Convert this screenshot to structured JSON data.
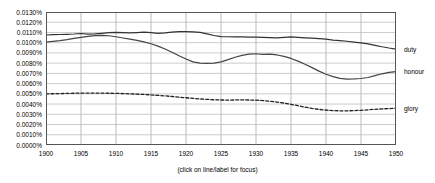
{
  "chart_data": {
    "type": "line",
    "title": "",
    "subtitle": "",
    "xlabel": "",
    "ylabel": "",
    "caption": "(click on line/label for focus)",
    "grid": true,
    "legend_position": "right-inline",
    "xlim": [
      1900,
      1950
    ],
    "ylim": [
      0.0,
      0.013
    ],
    "xticks": [
      1900,
      1905,
      1910,
      1915,
      1920,
      1925,
      1930,
      1935,
      1940,
      1945,
      1950
    ],
    "xtick_labels": [
      "1900",
      "1905",
      "1910",
      "1915",
      "1920",
      "1925",
      "1930",
      "1935",
      "1940",
      "1945",
      "1950"
    ],
    "yticks": [
      0.0,
      0.001,
      0.002,
      0.003,
      0.004,
      0.005,
      0.006,
      0.007,
      0.008,
      0.009,
      0.01,
      0.011,
      0.012,
      0.013
    ],
    "ytick_labels": [
      "0.0000%",
      "0.0010%",
      "0.0020%",
      "0.0030%",
      "0.0040%",
      "0.0050%",
      "0.0060%",
      "0.0070%",
      "0.0080%",
      "0.0090%",
      "0.0100%",
      "0.0110%",
      "0.0120%",
      "0.0130%"
    ],
    "x": [
      1900,
      1901,
      1902,
      1903,
      1904,
      1905,
      1906,
      1907,
      1908,
      1909,
      1910,
      1911,
      1912,
      1913,
      1914,
      1915,
      1916,
      1917,
      1918,
      1919,
      1920,
      1921,
      1922,
      1923,
      1924,
      1925,
      1926,
      1927,
      1928,
      1929,
      1930,
      1931,
      1932,
      1933,
      1934,
      1935,
      1936,
      1937,
      1938,
      1939,
      1940,
      1941,
      1942,
      1943,
      1944,
      1945,
      1946,
      1947,
      1948,
      1949,
      1950
    ],
    "series": [
      {
        "name": "duty",
        "color": "#333333",
        "style": "solid",
        "label_color": "#000000",
        "values": [
          0.01075,
          0.01078,
          0.0108,
          0.01082,
          0.01085,
          0.0109,
          0.01083,
          0.01086,
          0.01092,
          0.01098,
          0.011,
          0.01098,
          0.01095,
          0.01099,
          0.01104,
          0.01098,
          0.01092,
          0.01096,
          0.01104,
          0.01108,
          0.01108,
          0.01106,
          0.011,
          0.01086,
          0.0107,
          0.0106,
          0.01058,
          0.01057,
          0.01056,
          0.01055,
          0.01054,
          0.01052,
          0.0105,
          0.01048,
          0.01052,
          0.01056,
          0.01052,
          0.01048,
          0.01044,
          0.0104,
          0.01034,
          0.01026,
          0.0102,
          0.01014,
          0.01006,
          0.00998,
          0.00988,
          0.00974,
          0.0096,
          0.00948,
          0.00938
        ]
      },
      {
        "name": "honour",
        "color": "#444444",
        "style": "solid",
        "label_color": "#000000",
        "values": [
          0.01005,
          0.01012,
          0.0102,
          0.0103,
          0.01042,
          0.01052,
          0.01062,
          0.0107,
          0.01072,
          0.01068,
          0.01058,
          0.01046,
          0.01034,
          0.01022,
          0.01008,
          0.0099,
          0.00966,
          0.00938,
          0.00906,
          0.00872,
          0.0084,
          0.00812,
          0.008,
          0.00798,
          0.008,
          0.00812,
          0.00834,
          0.00858,
          0.00876,
          0.00888,
          0.00892,
          0.00886,
          0.00888,
          0.0088,
          0.00866,
          0.00846,
          0.0082,
          0.0079,
          0.00756,
          0.00722,
          0.00692,
          0.00668,
          0.00652,
          0.00644,
          0.00646,
          0.0065,
          0.0066,
          0.00678,
          0.00696,
          0.0071,
          0.00718
        ]
      },
      {
        "name": "glory",
        "color": "#222222",
        "style": "dashed",
        "label_color": "#000000",
        "values": [
          0.005,
          0.00501,
          0.00503,
          0.00504,
          0.00506,
          0.00507,
          0.00508,
          0.00508,
          0.00507,
          0.00506,
          0.00505,
          0.00503,
          0.005,
          0.00497,
          0.00494,
          0.0049,
          0.00485,
          0.0048,
          0.00474,
          0.00468,
          0.00462,
          0.00456,
          0.0045,
          0.00446,
          0.00442,
          0.0044,
          0.00439,
          0.0044,
          0.00441,
          0.0044,
          0.00438,
          0.00434,
          0.00428,
          0.0042,
          0.0041,
          0.00398,
          0.00384,
          0.0037,
          0.00358,
          0.00348,
          0.00341,
          0.00336,
          0.00334,
          0.00334,
          0.00336,
          0.00339,
          0.00344,
          0.00349,
          0.00353,
          0.00356,
          0.00358
        ]
      }
    ]
  }
}
